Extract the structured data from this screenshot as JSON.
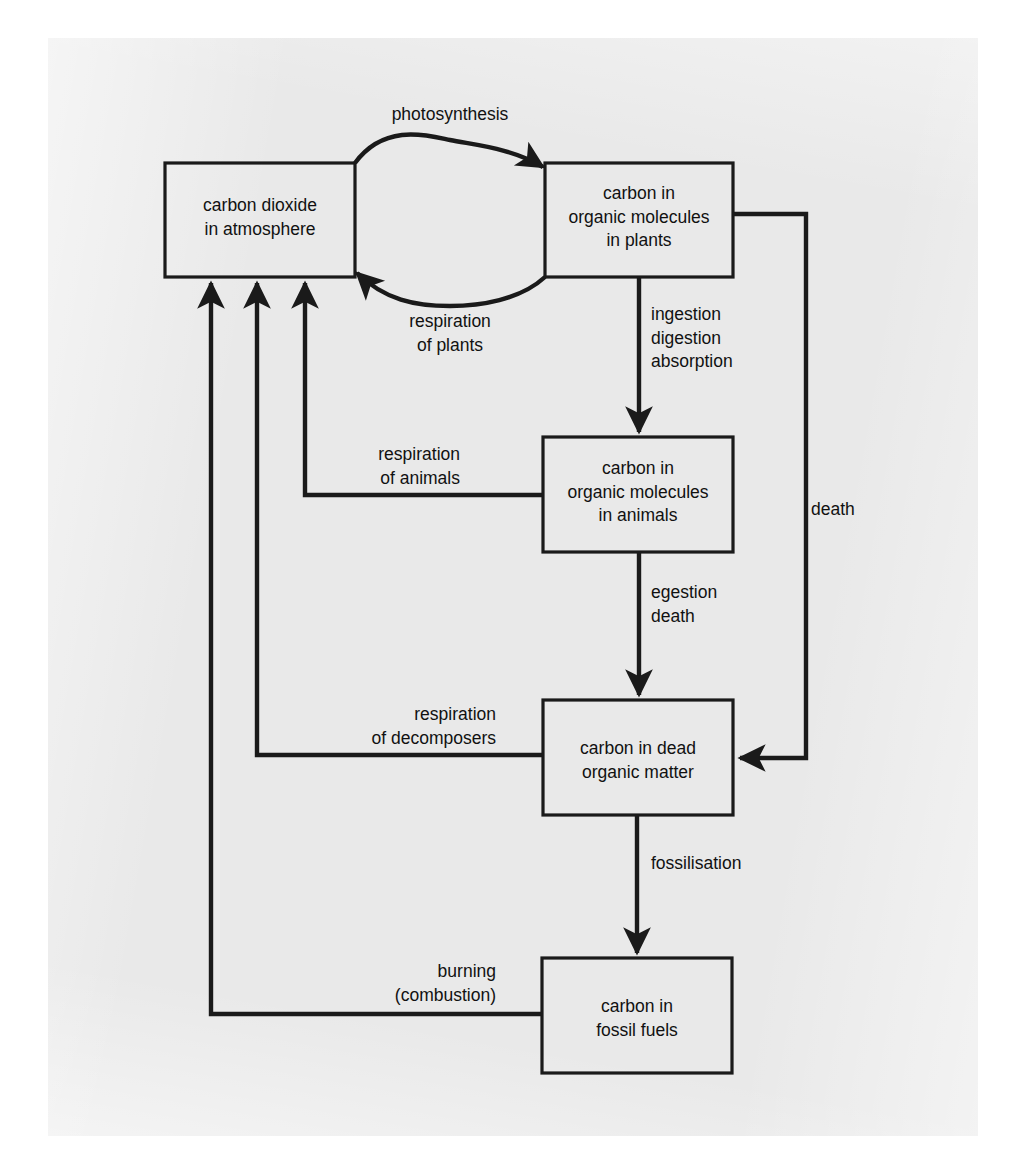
{
  "diagram": {
    "type": "flow-diagram",
    "stroke_color": "#1a1a1a",
    "text_color": "#111111",
    "paper_color": "#e9e9e9",
    "page_color": "#ffffff",
    "nodes": [
      {
        "id": "co2",
        "label": "carbon dioxide\nin atmosphere",
        "x": 165,
        "y": 163,
        "w": 190,
        "h": 114
      },
      {
        "id": "plants",
        "label": "carbon in\norganic molecules\nin plants",
        "x": 545,
        "y": 163,
        "w": 188,
        "h": 114
      },
      {
        "id": "animals",
        "label": "carbon in\norganic molecules\nin animals",
        "x": 543,
        "y": 437,
        "w": 190,
        "h": 115
      },
      {
        "id": "dead",
        "label": "carbon in dead\norganic matter",
        "x": 543,
        "y": 700,
        "w": 190,
        "h": 115
      },
      {
        "id": "fossil",
        "label": "carbon in\nfossil fuels",
        "x": 542,
        "y": 958,
        "w": 190,
        "h": 115
      }
    ],
    "edges": [
      {
        "id": "photosynthesis",
        "label": "photosynthesis",
        "from": "co2",
        "to": "plants",
        "label_x": 450,
        "label_y": 105,
        "label_align": "center"
      },
      {
        "id": "respiration-of-plants",
        "label": "respiration\nof plants",
        "from": "plants",
        "to": "co2",
        "label_x": 450,
        "label_y": 308,
        "label_align": "center"
      },
      {
        "id": "ingestion-digestion-absorption",
        "label": "ingestion\ndigestion\nabsorption",
        "from": "plants",
        "to": "animals",
        "label_x": 651,
        "label_y": 304,
        "label_align": "left"
      },
      {
        "id": "respiration-of-animals",
        "label": "respiration\nof animals",
        "from": "animals",
        "to": "co2",
        "label_x": 460,
        "label_y": 443,
        "label_align": "right"
      },
      {
        "id": "egestion-death",
        "label": "egestion\ndeath",
        "from": "animals",
        "to": "dead",
        "label_x": 651,
        "label_y": 581,
        "label_align": "left"
      },
      {
        "id": "death",
        "label": "death",
        "from": "plants",
        "to": "dead",
        "label_x": 811,
        "label_y": 507,
        "label_align": "left"
      },
      {
        "id": "respiration-of-decomposers",
        "label": "respiration\nof decomposers",
        "from": "dead",
        "to": "co2",
        "label_x": 496,
        "label_y": 703,
        "label_align": "right"
      },
      {
        "id": "fossilisation",
        "label": "fossilisation",
        "from": "dead",
        "to": "fossil",
        "label_x": 651,
        "label_y": 852,
        "label_align": "left"
      },
      {
        "id": "burning-combustion",
        "label": "burning\n(combustion)",
        "from": "fossil",
        "to": "co2",
        "label_x": 496,
        "label_y": 960,
        "label_align": "right"
      }
    ]
  }
}
